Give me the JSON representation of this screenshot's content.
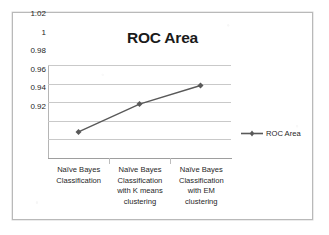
{
  "chart_data": {
    "type": "line",
    "title": "ROC Area",
    "xlabel": "",
    "ylabel": "",
    "categories": [
      "Naïve Bayes Classification",
      "Naïve Bayes Classification with K means clustering",
      "Naïve Bayes Classification with EM clustering"
    ],
    "series": [
      {
        "name": "ROC Area",
        "values": [
          0.948,
          0.978,
          0.998
        ]
      }
    ],
    "ylim": [
      0.92,
      1.02
    ],
    "y_ticks": [
      "1.02",
      "1",
      "0.98",
      "0.96",
      "0.94",
      "0.92"
    ],
    "y_tick_values": [
      1.02,
      1,
      0.98,
      0.96,
      0.94,
      0.92
    ],
    "grid": true,
    "legend_position": "right",
    "series_color": "#595959",
    "gridline_color": "#c9c9c9",
    "frame_color": "#b9b9b9"
  },
  "legend": {
    "entries": [
      {
        "label": "ROC Area",
        "marker": "line-with-diamond-marker"
      }
    ]
  }
}
